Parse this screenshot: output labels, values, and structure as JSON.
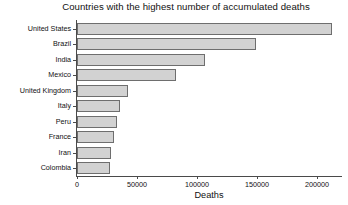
{
  "chart_data": {
    "type": "bar",
    "orientation": "horizontal",
    "title": "Countries with the highest number of accumulated deaths",
    "xlabel": "Deaths",
    "ylabel": "",
    "categories": [
      "United States",
      "Brazil",
      "India",
      "Mexico",
      "United Kingdom",
      "Peru",
      "Italy",
      "France",
      "Iran",
      "Colombia"
    ],
    "y_tick_labels": [
      "United States",
      "Brazil",
      "India",
      "Mexico",
      "United Kingdom",
      "Italy",
      "Peru",
      "France",
      "Iran",
      "Colombia"
    ],
    "values": [
      212500,
      149000,
      106500,
      82500,
      42500,
      36000,
      33000,
      31000,
      28000,
      27500
    ],
    "x_ticks": [
      0,
      50000,
      100000,
      150000,
      200000
    ],
    "x_tick_labels": [
      "0",
      "50000",
      "100000",
      "150000",
      "200000"
    ],
    "xlim": [
      0,
      220000
    ],
    "grid": false,
    "legend": false,
    "bar_fill_color": "#d2d2d2",
    "bar_edge_color": "#6e6e6e",
    "axis_color": "#4a4a4a",
    "background_color": "#ffffff"
  }
}
